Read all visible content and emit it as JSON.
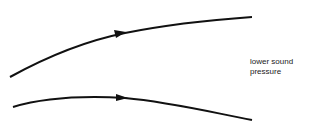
{
  "diagram": {
    "streamlines": [
      {
        "name": "upper-streamline",
        "direction": "left-to-right"
      },
      {
        "name": "lower-streamline",
        "direction": "left-to-right"
      }
    ],
    "label": {
      "line1": "lower sound",
      "line2": "pressure"
    },
    "colors": {
      "stroke": "#111111",
      "background": "#ffffff"
    }
  }
}
